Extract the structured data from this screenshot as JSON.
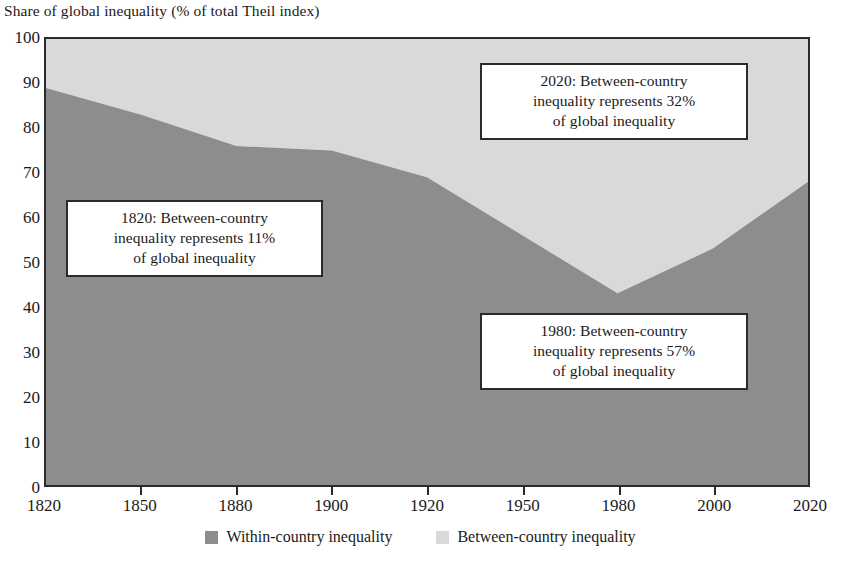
{
  "chart_data": {
    "type": "area",
    "stacked": true,
    "title": "Share of global inequality (% of total Theil index)",
    "ylabel": "Share of global inequality (% of total Theil index)",
    "xlabel": "",
    "ylim": [
      0,
      100
    ],
    "ytick_labels": [
      "0",
      "10",
      "20",
      "30",
      "40",
      "50",
      "60",
      "70",
      "80",
      "90",
      "100"
    ],
    "yticks": [
      0,
      10,
      20,
      30,
      40,
      50,
      60,
      70,
      80,
      90,
      100
    ],
    "grid": false,
    "legend_position": "bottom",
    "categories": [
      "1820",
      "1850",
      "1880",
      "1900",
      "1920",
      "1950",
      "1980",
      "2000",
      "2020"
    ],
    "x": [
      1820,
      1850,
      1880,
      1900,
      1920,
      1950,
      1980,
      2000,
      2020
    ],
    "series": [
      {
        "name": "Within-country inequality",
        "color": "#8d8d8d",
        "values": [
          89,
          83,
          76,
          75,
          69,
          56,
          43,
          53,
          68
        ]
      },
      {
        "name": "Between-country inequality",
        "color": "#d9d9d9",
        "values": [
          11,
          17,
          24,
          25,
          31,
          44,
          57,
          47,
          32
        ]
      }
    ],
    "annotations": [
      {
        "id": "annotation-1820",
        "lines": [
          "1820: Between-country",
          "inequality represents 11%",
          "of global inequality"
        ]
      },
      {
        "id": "annotation-2020",
        "lines": [
          "2020: Between-country",
          "inequality represents 32%",
          "of global inequality"
        ]
      },
      {
        "id": "annotation-1980",
        "lines": [
          "1980: Between-country",
          "inequality represents 57%",
          "of global inequality"
        ]
      }
    ]
  },
  "axis": {
    "title": "Share of global inequality (% of total Theil index)",
    "y_labels": [
      "100",
      "90",
      "80",
      "70",
      "60",
      "50",
      "40",
      "30",
      "20",
      "10",
      "0"
    ],
    "x_labels": [
      "1820",
      "1850",
      "1880",
      "1900",
      "1920",
      "1950",
      "1980",
      "2000",
      "2020"
    ]
  },
  "legend": {
    "entries": [
      {
        "label": "Within-country inequality",
        "color": "#8d8d8d"
      },
      {
        "label": "Between-country inequality",
        "color": "#d9d9d9"
      }
    ]
  },
  "annotations": {
    "box1": {
      "line1": "1820: Between-country",
      "line2": "inequality represents 11%",
      "line3": "of global inequality"
    },
    "box2": {
      "line1": "2020: Between-country",
      "line2": "inequality represents 32%",
      "line3": "of global inequality"
    },
    "box3": {
      "line1": "1980: Between-country",
      "line2": "inequality represents 57%",
      "line3": "of global inequality"
    }
  },
  "colors": {
    "within": "#8d8d8d",
    "between": "#d9d9d9",
    "axis": "#2b2b2b",
    "text": "#1a1a1a",
    "background": "#ffffff"
  }
}
